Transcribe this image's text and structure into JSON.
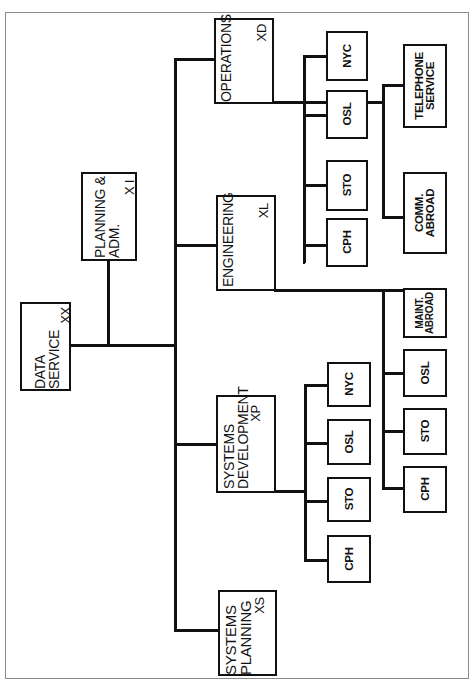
{
  "diagram": {
    "type": "organization-chart",
    "orientation": "rotated-90-ccw",
    "root": {
      "title_line1": "DATA",
      "title_line2": "SERVICE",
      "code": "XX"
    },
    "staff": {
      "title_line1": "PLANNING &",
      "title_line2": "ADM.",
      "code": "X I"
    },
    "departments": [
      {
        "title_line1": "OPERATIONS",
        "title_line2": "",
        "code": "XD",
        "units": [
          "NYC",
          "OSL",
          "STO",
          "CPH"
        ],
        "special_units": [
          {
            "line1": "TELEPHONE",
            "line2": "SERVICE"
          },
          {
            "line1": "COMM.",
            "line2": "ABROAD"
          }
        ]
      },
      {
        "title_line1": "ENGINEERING",
        "title_line2": "",
        "code": "XL",
        "units": [
          "CPH",
          "STO",
          "OSL"
        ],
        "special_units": [
          {
            "line1": "MAINT.",
            "line2": "ABROAD"
          }
        ]
      },
      {
        "title_line1": "SYSTEMS",
        "title_line2": "DEVELOPMENT",
        "code": "XP",
        "units": [
          "NYC",
          "OSL",
          "STO",
          "CPH"
        ]
      },
      {
        "title_line1": "SYSTEMS",
        "title_line2": "PLANNING",
        "code": "XS"
      }
    ]
  },
  "colors": {
    "line": "#111111",
    "background": "#ffffff",
    "frame": "#8a8a8a"
  }
}
